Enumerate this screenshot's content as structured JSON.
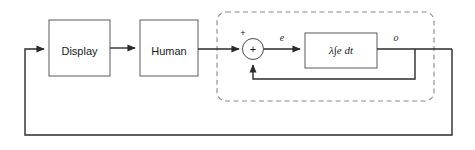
{
  "diagram": {
    "background_color": "#ffffff",
    "line_color": "#2b2b2b",
    "box_stroke_color": "#5a5a5a",
    "dashed_region_color": "#8a8a8a",
    "blocks": [
      {
        "id": "display",
        "label": "Display"
      },
      {
        "id": "human",
        "label": "Human"
      },
      {
        "id": "integrator",
        "label": "λ∫e dt"
      }
    ],
    "summing_junction": {
      "id": "summer",
      "inner_symbol": "+",
      "input_sign_top": "+",
      "input_sign_bottom": ""
    },
    "signals": [
      {
        "id": "error",
        "label": "e"
      },
      {
        "id": "output",
        "label": "o"
      }
    ],
    "region": {
      "id": "controlled-element",
      "style": "dashed",
      "label": ""
    }
  }
}
